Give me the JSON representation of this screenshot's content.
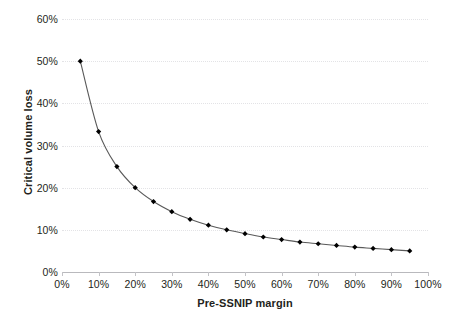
{
  "chart_data": {
    "type": "line",
    "title": "",
    "xlabel": "Pre-SSNIP margin",
    "ylabel": "Critical volume loss",
    "xlim": [
      0,
      100
    ],
    "ylim": [
      0,
      60
    ],
    "grid": true,
    "legend": false,
    "marker": "diamond",
    "series_color": "#000000",
    "line_color": "#595959",
    "gridline_color": "#e3e3e6",
    "axis_color": "#b9b9bd",
    "x_tick_labels": [
      "0%",
      "10%",
      "20%",
      "30%",
      "40%",
      "50%",
      "60%",
      "70%",
      "80%",
      "90%",
      "100%"
    ],
    "x_ticks": [
      0,
      10,
      20,
      30,
      40,
      50,
      60,
      70,
      80,
      90,
      100
    ],
    "y_tick_labels": [
      "0%",
      "10%",
      "20%",
      "30%",
      "40%",
      "50%",
      "60%"
    ],
    "y_ticks": [
      0,
      10,
      20,
      30,
      40,
      50,
      60
    ],
    "x": [
      5,
      10,
      15,
      20,
      25,
      30,
      35,
      40,
      45,
      50,
      55,
      60,
      65,
      70,
      75,
      80,
      85,
      90,
      95
    ],
    "values": [
      50.0,
      33.3,
      25.0,
      20.0,
      16.7,
      14.3,
      12.5,
      11.1,
      10.0,
      9.1,
      8.3,
      7.7,
      7.1,
      6.7,
      6.3,
      5.9,
      5.6,
      5.3,
      5.0
    ],
    "annotations": []
  }
}
